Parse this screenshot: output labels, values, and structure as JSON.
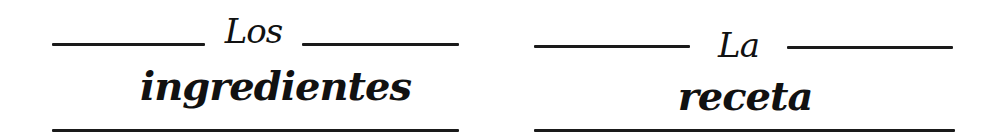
{
  "panels": [
    {
      "id": "ingredients",
      "small_word": "Los",
      "large_word": "ingredientes"
    },
    {
      "id": "recipe",
      "small_word": "La",
      "large_word": "receta"
    }
  ],
  "colors": {
    "ink": "#111111",
    "rule": "#1a1a1a",
    "background": "#ffffff"
  }
}
